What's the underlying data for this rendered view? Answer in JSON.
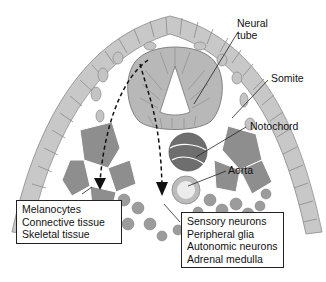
{
  "figure": {
    "type": "embryo-cross-section",
    "colors": {
      "ectoderm": "#c8c8c8",
      "neural_tube": "#b4b4b4",
      "somite": "#8c8c8c",
      "notochord": "#6a6a6a",
      "aorta_wall": "#b8b8b8",
      "aorta_lumen": "#e8e8e8",
      "mesenchyme": "#9a9a9a",
      "arrow": "#111111",
      "outline": "#777777"
    }
  },
  "labels": {
    "neural_tube_line1": "Neural",
    "neural_tube_line2": "tube",
    "somite": "Somite",
    "notochord": "Notochord",
    "aorta": "Aorta"
  },
  "boxes": {
    "dorsolateral": {
      "items": [
        "Melanocytes",
        "Connective tissue",
        "Skeletal tissue"
      ]
    },
    "ventral": {
      "items": [
        "Sensory neurons",
        "Peripheral glia",
        "Autonomic neurons",
        "Adrenal medulla"
      ]
    }
  },
  "pathways": [
    {
      "name": "dorsolateral-pathway",
      "style": "dashed-arrow"
    },
    {
      "name": "ventral-pathway",
      "style": "dashed-arrow"
    }
  ]
}
